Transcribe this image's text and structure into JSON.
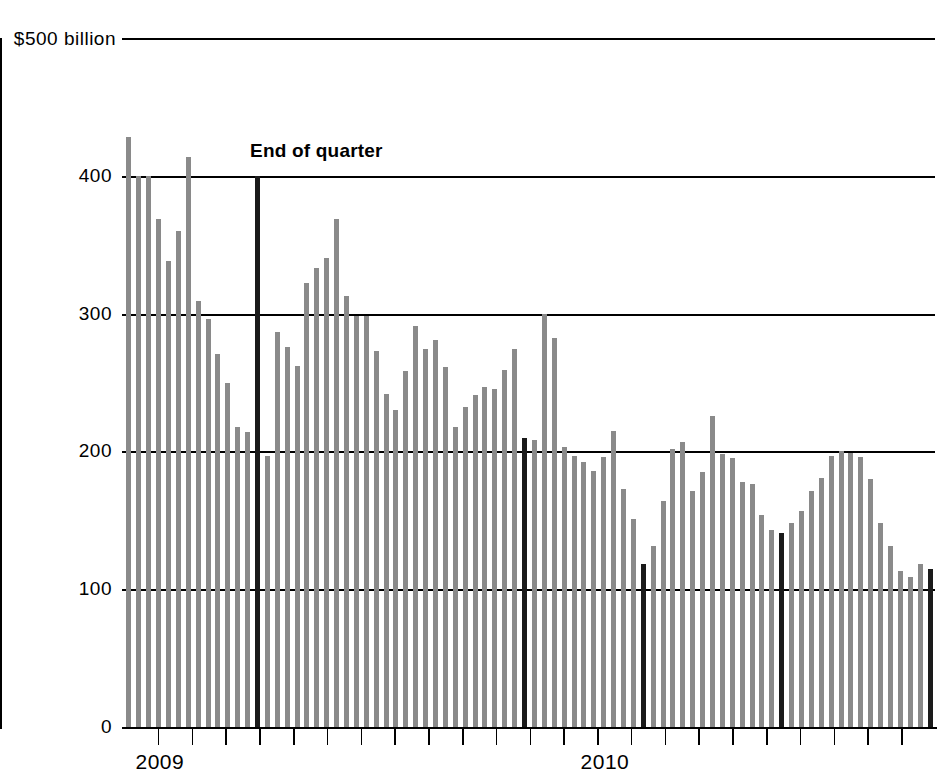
{
  "chart_data": {
    "type": "bar",
    "title": "",
    "subtitle": "",
    "xlabel": "",
    "ylabel": "",
    "y_axis_top_label": "$500 billion",
    "ytick_labels": [
      "400",
      "300",
      "200",
      "100",
      "0"
    ],
    "ytick_values": [
      400,
      300,
      200,
      100,
      0
    ],
    "ylim": [
      0,
      500
    ],
    "grid": true,
    "legend_position": "none",
    "annotations": [
      {
        "text": "End of quarter",
        "points_to_series": "end-of-quarter",
        "x_index": 13
      }
    ],
    "xtick_labels": [
      "2009",
      "2010"
    ],
    "xtick_label_positions": [
      1,
      46
    ],
    "series": [
      {
        "name": "Weekly balance",
        "color": "#8a8a8a",
        "unit": "$ billion",
        "values": [
          428,
          400,
          400,
          369,
          338,
          360,
          414,
          309,
          296,
          271,
          250,
          218,
          214,
          400,
          197,
          287,
          276,
          262,
          322,
          333,
          340,
          369,
          313,
          298,
          298,
          273,
          242,
          230,
          258,
          291,
          274,
          281,
          261,
          218,
          232,
          241,
          247,
          245,
          259,
          274,
          210,
          208,
          300,
          282,
          203,
          197,
          192,
          186,
          196,
          215,
          173,
          151,
          118,
          131,
          164,
          202,
          207,
          171,
          185,
          226,
          198,
          195,
          178,
          176,
          154,
          143,
          141,
          148,
          157,
          171,
          181,
          197,
          200,
          199,
          196,
          180,
          148,
          131,
          113,
          109,
          118,
          115
        ]
      }
    ],
    "end_of_quarter_indices": [
      13,
      40,
      52,
      66,
      81
    ],
    "bar_count": 82,
    "colors": {
      "bar": "#8a8a8a",
      "end_of_quarter_bar": "#1a1a1a",
      "axis": "#000000",
      "background": "#ffffff"
    }
  }
}
